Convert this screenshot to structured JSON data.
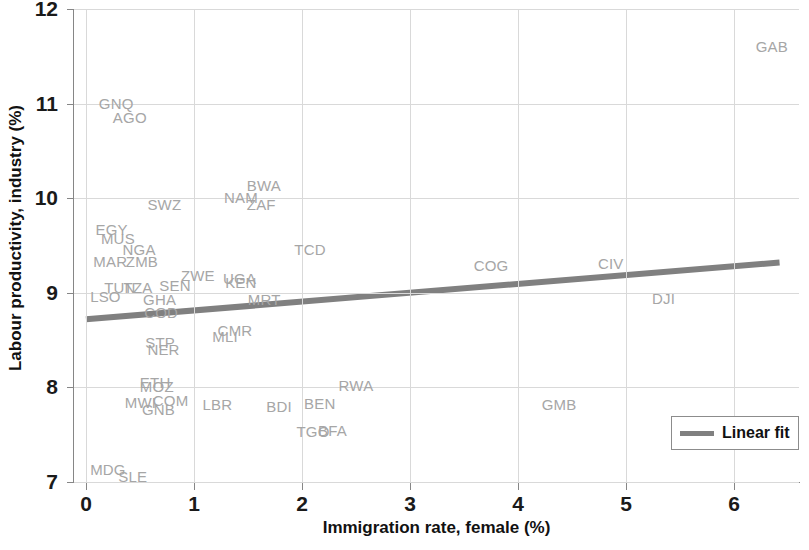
{
  "chart_data": {
    "type": "scatter",
    "title": "",
    "subtitle": "",
    "xlabel": "Immigration rate, female (%)",
    "ylabel": "Labour productivity, industry (%)",
    "xlim": [
      -0.12,
      6.6
    ],
    "ylim": [
      7,
      12
    ],
    "xticks": [
      0,
      1,
      2,
      3,
      4,
      5,
      6
    ],
    "xtick_labels": [
      "0",
      "1",
      "2",
      "3",
      "4",
      "5",
      "6"
    ],
    "yticks": [
      7,
      8,
      9,
      10,
      11,
      12
    ],
    "ytick_labels": [
      "7",
      "8",
      "9",
      "10",
      "11",
      "12"
    ],
    "grid": true,
    "legend_position": "bottom-right",
    "label_color": "#a6a6a6",
    "fit_color": "#808080",
    "points": [
      {
        "label": "GAB",
        "x": 6.18,
        "y": 11.6
      },
      {
        "label": "GNQ",
        "x": 0.1,
        "y": 11.0
      },
      {
        "label": "AGO",
        "x": 0.23,
        "y": 10.85
      },
      {
        "label": "BWA",
        "x": 1.47,
        "y": 10.13
      },
      {
        "label": "NAM",
        "x": 1.26,
        "y": 10.0
      },
      {
        "label": "ZAF",
        "x": 1.47,
        "y": 9.93
      },
      {
        "label": "SWZ",
        "x": 0.55,
        "y": 9.93
      },
      {
        "label": "EGY",
        "x": 0.07,
        "y": 9.66
      },
      {
        "label": "MUS",
        "x": 0.12,
        "y": 9.57
      },
      {
        "label": "NGA",
        "x": 0.32,
        "y": 9.45
      },
      {
        "label": "TCD",
        "x": 1.91,
        "y": 9.45
      },
      {
        "label": "MAR",
        "x": 0.05,
        "y": 9.33
      },
      {
        "label": "ZMB",
        "x": 0.35,
        "y": 9.33
      },
      {
        "label": "COG",
        "x": 3.57,
        "y": 9.28
      },
      {
        "label": "CIV",
        "x": 4.72,
        "y": 9.3
      },
      {
        "label": "ZWE",
        "x": 0.86,
        "y": 9.18
      },
      {
        "label": "UGA",
        "x": 1.25,
        "y": 9.15
      },
      {
        "label": "KEN",
        "x": 1.27,
        "y": 9.1
      },
      {
        "label": "TUN",
        "x": 0.15,
        "y": 9.05
      },
      {
        "label": "TZA",
        "x": 0.33,
        "y": 9.05
      },
      {
        "label": "SEN",
        "x": 0.66,
        "y": 9.07
      },
      {
        "label": "LSO",
        "x": 0.02,
        "y": 8.96
      },
      {
        "label": "GHA",
        "x": 0.51,
        "y": 8.92
      },
      {
        "label": "COD",
        "x": 0.52,
        "y": 8.79
      },
      {
        "label": "MRT",
        "x": 1.48,
        "y": 8.92
      },
      {
        "label": "DJI",
        "x": 5.22,
        "y": 8.93
      },
      {
        "label": "CMR",
        "x": 1.2,
        "y": 8.6
      },
      {
        "label": "MLI",
        "x": 1.15,
        "y": 8.53
      },
      {
        "label": "STP",
        "x": 0.53,
        "y": 8.47
      },
      {
        "label": "NER",
        "x": 0.55,
        "y": 8.4
      },
      {
        "label": "ETH",
        "x": 0.48,
        "y": 8.05
      },
      {
        "label": "MOZ",
        "x": 0.48,
        "y": 8.0
      },
      {
        "label": "RWA",
        "x": 2.32,
        "y": 8.02
      },
      {
        "label": "MWI",
        "x": 0.34,
        "y": 7.84
      },
      {
        "label": "COM",
        "x": 0.6,
        "y": 7.86
      },
      {
        "label": "GNB",
        "x": 0.5,
        "y": 7.76
      },
      {
        "label": "LBR",
        "x": 1.06,
        "y": 7.81
      },
      {
        "label": "BDI",
        "x": 1.65,
        "y": 7.79
      },
      {
        "label": "BEN",
        "x": 2.0,
        "y": 7.82
      },
      {
        "label": "GMB",
        "x": 4.2,
        "y": 7.81
      },
      {
        "label": "TGO",
        "x": 1.93,
        "y": 7.53
      },
      {
        "label": "BFA",
        "x": 2.13,
        "y": 7.54
      },
      {
        "label": "MDG",
        "x": 0.02,
        "y": 7.13
      },
      {
        "label": "SLE",
        "x": 0.28,
        "y": 7.05
      }
    ],
    "fit": {
      "name": "Linear fit",
      "x_start": 0.0,
      "y_start": 8.72,
      "x_end": 6.42,
      "y_end": 9.32
    }
  },
  "legend": {
    "label": "Linear fit"
  }
}
